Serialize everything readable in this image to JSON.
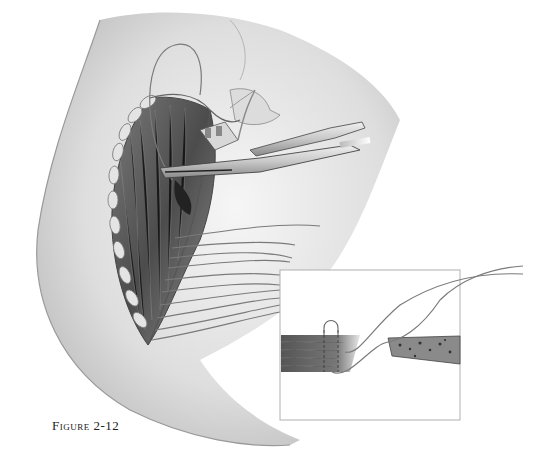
{
  "figure": {
    "caption_label": "Figure",
    "caption_number": "2-12"
  },
  "colors": {
    "background": "#ffffff",
    "skin_light": "#ececec",
    "skin_mid": "#bdbdbd",
    "skin_dark": "#8a8a8a",
    "muscle": "#5a5a5a",
    "suture": "#7a7a7a",
    "inset_border": "#b0b0b0",
    "caption": "#222222"
  },
  "inset": {
    "x": 280,
    "y": 270,
    "width": 180,
    "height": 150
  }
}
